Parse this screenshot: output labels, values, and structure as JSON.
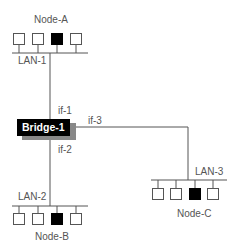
{
  "diagram": {
    "bridge": {
      "label": "Bridge-1",
      "fill": "#000000",
      "shadow": "#888888"
    },
    "interfaces": {
      "if1": "if-1",
      "if2": "if-2",
      "if3": "if-3"
    },
    "lans": {
      "lan1": {
        "label": "LAN-1",
        "node_label": "Node-A"
      },
      "lan2": {
        "label": "LAN-2",
        "node_label": "Node-B"
      },
      "lan3": {
        "label": "LAN-3",
        "node_label": "Node-C"
      }
    },
    "colors": {
      "line": "#555555",
      "host_fill": "#ffffff",
      "highlight_host": "#000000"
    }
  }
}
